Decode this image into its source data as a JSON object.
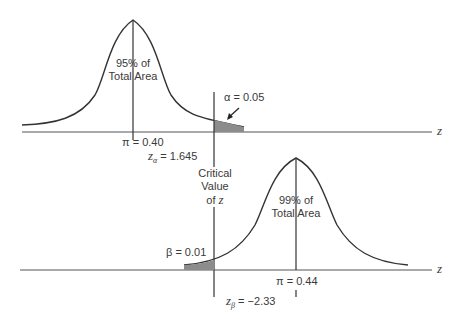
{
  "top_distribution": {
    "area_label_line1": "95% of",
    "area_label_line2": "Total Area",
    "mean_label": "π = 0.40",
    "z_label_sym": "z",
    "z_label_sub": "α",
    "z_label_val": "= 1.645",
    "tail_label": "α = 0.05"
  },
  "bottom_distribution": {
    "area_label_line1": "99% of",
    "area_label_line2": "Total Area",
    "mean_label": "π = 0.44",
    "z_label_sym": "z",
    "z_label_sub": "β",
    "z_label_val": "= −2.33",
    "tail_label": "β = 0.01"
  },
  "critical": {
    "line1": "Critical",
    "line2": "Value",
    "line3_prefix": "of",
    "line3_var": "z"
  },
  "axes": {
    "top_axis_label": "z",
    "bottom_axis_label": "z"
  },
  "colors": {
    "line": "#3a3a3a",
    "shade": "#8c8c8c"
  }
}
